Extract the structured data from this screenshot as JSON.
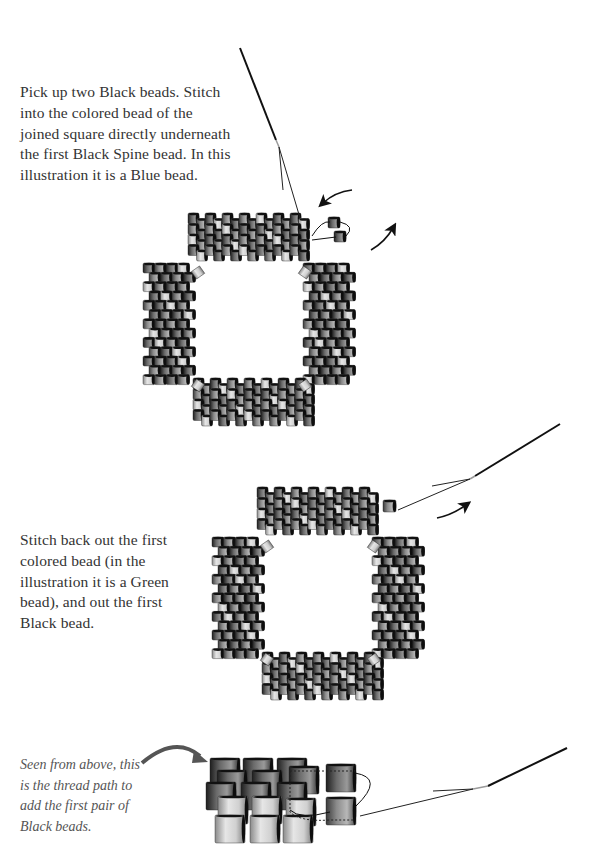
{
  "step1": {
    "text_lines": [
      "Pick up two Black beads. Stitch",
      "into the colored bead of the",
      "joined square directly underneath",
      "the first Black Spine bead. In this",
      "illustration it is a Blue bead."
    ]
  },
  "step2": {
    "text_lines": [
      "Stitch back out the first",
      "colored bead (in the",
      "illustration it is a Green",
      "bead), and out the first",
      "Black bead."
    ]
  },
  "detail": {
    "caption_lines": [
      "Seen from above, this",
      "is the thread path to",
      "add the first pair of",
      "Black beads."
    ]
  },
  "colors": {
    "text": "#333333",
    "caption": "#555555",
    "bead_dark": "#3a3a3a",
    "bead_mid": "#8a8a8a",
    "bead_light": "#d6d6d6",
    "thread": "#111111"
  }
}
